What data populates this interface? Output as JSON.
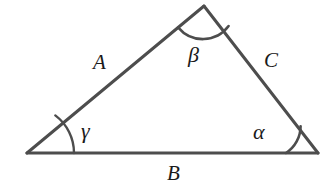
{
  "figure": {
    "kind": "geometry-diagram",
    "background_color": "#ffffff",
    "stroke_color": "#4d4d4d",
    "arc_color": "#4d4d4d",
    "text_color": "#1a1a1a",
    "stroke_width": 3,
    "arc_width": 2.4
  },
  "vertices": {
    "left": {
      "name": "left-vertex",
      "x": 27,
      "y": 153
    },
    "apex": {
      "name": "apex-vertex",
      "x": 204,
      "y": 6
    },
    "right": {
      "name": "right-vertex",
      "x": 318,
      "y": 153
    }
  },
  "sides": [
    {
      "id": "a",
      "label": "A",
      "from": "left",
      "to": "apex",
      "position": "upper-left"
    },
    {
      "id": "b",
      "label": "B",
      "from": "left",
      "to": "right",
      "position": "bottom"
    },
    {
      "id": "c",
      "label": "C",
      "from": "apex",
      "to": "right",
      "position": "upper-right"
    }
  ],
  "angles": [
    {
      "id": "alpha",
      "label": "α",
      "at": "right",
      "arc_radius": 32
    },
    {
      "id": "beta",
      "label": "β",
      "at": "apex",
      "arc_radius": 32
    },
    {
      "id": "gamma",
      "label": "γ",
      "at": "left",
      "arc_radius": 47
    }
  ]
}
